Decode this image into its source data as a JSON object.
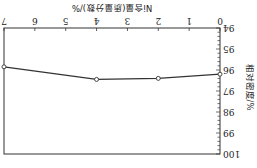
{
  "chart_data": {
    "type": "line",
    "title": "",
    "xlabel": "Ni含量(质量分数)/%",
    "ylabel": "相对密度/%",
    "xlim": [
      0,
      7
    ],
    "ylim": [
      94,
      100
    ],
    "xticks": [
      0,
      1,
      2,
      3,
      4,
      5,
      6,
      7
    ],
    "yticks": [
      94,
      95,
      96,
      97,
      98,
      99,
      100
    ],
    "grid": false,
    "orientation_note": "image rendered rotated 180 degrees",
    "series": [
      {
        "name": "相对密度",
        "x": [
          0,
          2,
          4,
          7
        ],
        "y": [
          96.2,
          96.4,
          96.45,
          95.85
        ],
        "marker": "open-circle"
      }
    ]
  },
  "axes": {
    "xlabel": "Ni含量(质量分数)/%",
    "ylabel": "相对密度/%"
  },
  "colors": {
    "line": "#333333",
    "axis": "#333333",
    "background": "#ffffff"
  }
}
